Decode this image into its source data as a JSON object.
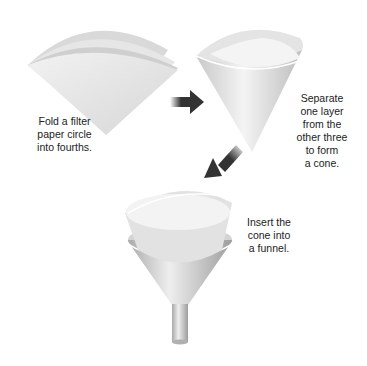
{
  "steps": [
    {
      "id": 1,
      "lines": [
        "Fold a filter",
        "paper circle",
        "into fourths."
      ],
      "illustration": "folded-quarter-filter-paper"
    },
    {
      "id": 2,
      "lines": [
        "Separate",
        "one layer",
        "from the",
        "other three",
        "to form",
        "a cone."
      ],
      "illustration": "paper-cone"
    },
    {
      "id": 3,
      "lines": [
        "Insert the",
        "cone into",
        "a funnel."
      ],
      "illustration": "cone-in-funnel"
    }
  ],
  "arrows": [
    {
      "from": 1,
      "to": 2,
      "direction": "right"
    },
    {
      "from": 2,
      "to": 3,
      "direction": "down-left"
    }
  ],
  "colors": {
    "arrow": "#333333",
    "paper": "#e8e8e8",
    "funnel": "#c8c8c8",
    "text": "#222222"
  }
}
